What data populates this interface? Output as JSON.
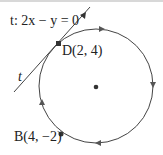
{
  "diagram": {
    "line_label": "t: 2x − y = 0",
    "line_name": "t",
    "point_d": "D(2, 4)",
    "point_b": "B(4, −2)",
    "colors": {
      "stroke": "#444444",
      "point": "#333333",
      "text": "#222222"
    }
  }
}
